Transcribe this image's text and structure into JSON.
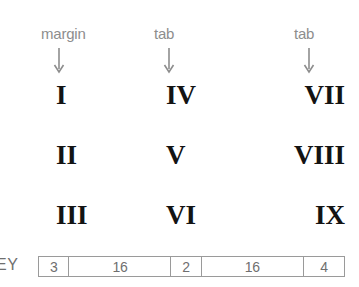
{
  "diagram": {
    "annotations": [
      {
        "label": "margin",
        "icon": "down-arrow-icon"
      },
      {
        "label": "tab",
        "icon": "down-arrow-icon"
      },
      {
        "label": "tab",
        "icon": "down-arrow-icon"
      }
    ],
    "grid": {
      "rows": [
        [
          "I",
          "IV",
          "VII"
        ],
        [
          "II",
          "V",
          "VIII"
        ],
        [
          "III",
          "VI",
          "IX"
        ]
      ]
    },
    "key": {
      "label": "EY",
      "cells": [
        {
          "value": "3",
          "flex": 30
        },
        {
          "value": "16",
          "flex": 103
        },
        {
          "value": "2",
          "flex": 30
        },
        {
          "value": "16",
          "flex": 103
        },
        {
          "value": "4",
          "flex": 41
        }
      ]
    },
    "colors": {
      "annotation": "#8d8d8d",
      "numeral": "#131313",
      "bar_border": "#9a9a9a",
      "bar_text": "#6f6f6f",
      "background": "#ffffff"
    }
  }
}
